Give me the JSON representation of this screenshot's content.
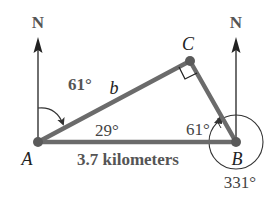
{
  "diagram": {
    "type": "bearing-triangle",
    "points": {
      "A": {
        "label": "A",
        "x": 38,
        "y": 142
      },
      "B": {
        "label": "B",
        "x": 236,
        "y": 142
      },
      "C": {
        "label": "C",
        "x": 190,
        "y": 61
      }
    },
    "north_labels": {
      "at_A": "N",
      "at_B": "N"
    },
    "sides": {
      "AC": "b",
      "AB": "3.7 kilometers"
    },
    "angles": {
      "bearing_A": "61°",
      "angle_A": "29°",
      "angle_B": "61°",
      "bearing_B": "331°"
    },
    "right_angle_at": "C",
    "colors": {
      "triangle": "#6b6b6b",
      "arrow": "#333333",
      "text_bold": "#555555",
      "text_italic": "#222222"
    }
  }
}
